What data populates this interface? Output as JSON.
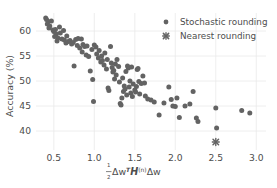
{
  "figure": {
    "background_color": "#ffffff",
    "grid_color": "#eaeaea",
    "text_color": "#4d4d4d",
    "marker_color": "#636363"
  },
  "legend": {
    "position": "top-right",
    "entries": [
      {
        "label": "Stochastic rounding",
        "marker": "circle-marker",
        "color": "#636363"
      },
      {
        "label": "Nearest rounding",
        "marker": "x-cross-marker",
        "color": "#636363"
      }
    ]
  },
  "chart_data": {
    "type": "scatter",
    "title": "",
    "xlabel": "½ΔwᵀH⁽ⁿ⁾Δw",
    "xlabel_parts": {
      "fraction_num": "1",
      "fraction_den": "2",
      "delta_w_1": "Δw",
      "transpose": "T",
      "hessian": "H",
      "superscript": "(n)",
      "delta_w_2": "Δw"
    },
    "ylabel": "Accuracy (%)",
    "xlim": [
      0.28,
      3.12
    ],
    "ylim": [
      36.2,
      63.6
    ],
    "xticks": [
      0.5,
      1.0,
      1.5,
      2.0,
      2.5,
      3.0
    ],
    "xticklabels": [
      "0.5",
      "1.0",
      "1.5",
      "2.0",
      "2.5",
      "3.0"
    ],
    "yticks": [
      40,
      45,
      50,
      55,
      60
    ],
    "yticklabels": [
      "40",
      "45",
      "50",
      "55",
      "60"
    ],
    "grid": true,
    "legend_position": "upper right",
    "series": [
      {
        "name": "Stochastic rounding",
        "marker": "circle",
        "color": "#636363",
        "points": [
          [
            0.4,
            62.6
          ],
          [
            0.41,
            62.3
          ],
          [
            0.43,
            61.9
          ],
          [
            0.42,
            61.4
          ],
          [
            0.45,
            61.0
          ],
          [
            0.44,
            60.6
          ],
          [
            0.47,
            62.0
          ],
          [
            0.49,
            60.2
          ],
          [
            0.5,
            59.9
          ],
          [
            0.52,
            60.3
          ],
          [
            0.53,
            59.4
          ],
          [
            0.51,
            58.9
          ],
          [
            0.55,
            58.6
          ],
          [
            0.54,
            58.0
          ],
          [
            0.57,
            60.8
          ],
          [
            0.58,
            59.6
          ],
          [
            0.6,
            58.4
          ],
          [
            0.62,
            60.1
          ],
          [
            0.63,
            58.2
          ],
          [
            0.65,
            57.6
          ],
          [
            0.66,
            59.0
          ],
          [
            0.68,
            57.9
          ],
          [
            0.7,
            58.1
          ],
          [
            0.72,
            57.4
          ],
          [
            0.74,
            57.7
          ],
          [
            0.75,
            53.0
          ],
          [
            0.77,
            58.3
          ],
          [
            0.79,
            57.1
          ],
          [
            0.8,
            58.5
          ],
          [
            0.82,
            56.6
          ],
          [
            0.84,
            58.4
          ],
          [
            0.85,
            55.8
          ],
          [
            0.86,
            57.3
          ],
          [
            0.88,
            56.9
          ],
          [
            0.9,
            55.2
          ],
          [
            0.91,
            57.0
          ],
          [
            0.93,
            54.9
          ],
          [
            0.95,
            52.0
          ],
          [
            0.97,
            56.3
          ],
          [
            0.98,
            50.3
          ],
          [
            0.99,
            45.9
          ],
          [
            1.0,
            57.2
          ],
          [
            1.02,
            56.8
          ],
          [
            1.03,
            55.4
          ],
          [
            1.05,
            54.6
          ],
          [
            1.06,
            56.1
          ],
          [
            1.08,
            53.8
          ],
          [
            1.09,
            55.0
          ],
          [
            1.1,
            54.1
          ],
          [
            1.12,
            53.2
          ],
          [
            1.13,
            55.6
          ],
          [
            1.15,
            52.4
          ],
          [
            1.16,
            54.3
          ],
          [
            1.17,
            48.6
          ],
          [
            1.18,
            48.1
          ],
          [
            1.2,
            56.9
          ],
          [
            1.21,
            53.6
          ],
          [
            1.22,
            52.7
          ],
          [
            1.23,
            51.8
          ],
          [
            1.24,
            52.1
          ],
          [
            1.25,
            50.4
          ],
          [
            1.26,
            53.4
          ],
          [
            1.27,
            51.2
          ],
          [
            1.28,
            54.3
          ],
          [
            1.3,
            52.9
          ],
          [
            1.31,
            49.8
          ],
          [
            1.32,
            45.5
          ],
          [
            1.33,
            45.2
          ],
          [
            1.34,
            46.6
          ],
          [
            1.35,
            50.6
          ],
          [
            1.36,
            47.9
          ],
          [
            1.37,
            49.0
          ],
          [
            1.38,
            48.4
          ],
          [
            1.39,
            51.9
          ],
          [
            1.4,
            47.2
          ],
          [
            1.41,
            53.0
          ],
          [
            1.42,
            52.6
          ],
          [
            1.43,
            48.8
          ],
          [
            1.44,
            50.0
          ],
          [
            1.45,
            47.6
          ],
          [
            1.46,
            52.8
          ],
          [
            1.47,
            46.9
          ],
          [
            1.48,
            49.4
          ],
          [
            1.5,
            48.2
          ],
          [
            1.51,
            47.8
          ],
          [
            1.52,
            48.9
          ],
          [
            1.53,
            52.3
          ],
          [
            1.54,
            52.5
          ],
          [
            1.55,
            49.9
          ],
          [
            1.56,
            47.4
          ],
          [
            1.58,
            49.5
          ],
          [
            1.6,
            51.0
          ],
          [
            1.62,
            49.6
          ],
          [
            1.63,
            47.0
          ],
          [
            1.66,
            46.4
          ],
          [
            1.7,
            46.2
          ],
          [
            1.74,
            45.8
          ],
          [
            1.8,
            43.2
          ],
          [
            1.86,
            45.6
          ],
          [
            1.92,
            48.8
          ],
          [
            1.95,
            46.3
          ],
          [
            1.97,
            45.0
          ],
          [
            2.0,
            44.9
          ],
          [
            2.02,
            46.6
          ],
          [
            2.05,
            42.7
          ],
          [
            2.12,
            45.0
          ],
          [
            2.18,
            45.4
          ],
          [
            2.22,
            47.9
          ],
          [
            2.26,
            42.6
          ],
          [
            2.28,
            41.9
          ],
          [
            2.5,
            44.6
          ],
          [
            2.51,
            40.6
          ],
          [
            2.82,
            44.1
          ],
          [
            2.92,
            43.6
          ]
        ]
      },
      {
        "name": "Nearest rounding",
        "marker": "x-cross",
        "color": "#636363",
        "points": [
          [
            2.5,
            37.8
          ]
        ]
      }
    ]
  }
}
